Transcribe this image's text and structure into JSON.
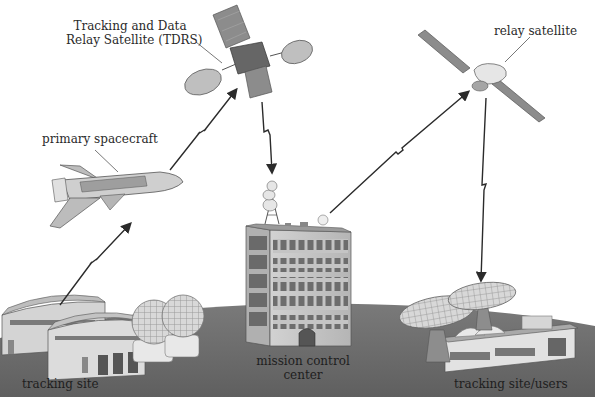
{
  "diagram": {
    "type": "satellite communication network",
    "labels": {
      "tdrs_line1": "Tracking and Data",
      "tdrs_line2": "Relay Satellite (TDRS)",
      "relay_satellite": "relay satellite",
      "primary_spacecraft": "primary spacecraft",
      "mission_control_line1": "mission control",
      "mission_control_line2": "center",
      "tracking_site": "tracking site",
      "tracking_site_users": "tracking site/users"
    },
    "nodes": [
      {
        "id": "tdrs",
        "label": "Tracking and Data Relay Satellite (TDRS)"
      },
      {
        "id": "relay",
        "label": "relay satellite"
      },
      {
        "id": "shuttle",
        "label": "primary spacecraft"
      },
      {
        "id": "mcc",
        "label": "mission control center"
      },
      {
        "id": "site_left",
        "label": "tracking site"
      },
      {
        "id": "site_right",
        "label": "tracking site/users"
      }
    ],
    "links": [
      {
        "from": "tracking site",
        "to": "primary spacecraft"
      },
      {
        "from": "primary spacecraft",
        "to": "Tracking and Data Relay Satellite (TDRS)"
      },
      {
        "from": "Tracking and Data Relay Satellite (TDRS)",
        "to": "mission control center"
      },
      {
        "from": "mission control center",
        "to": "relay satellite"
      },
      {
        "from": "relay satellite",
        "to": "tracking site/users"
      }
    ],
    "colors": {
      "ground": "#6f6f6f",
      "ground_light": "#8a8a8a",
      "background": "#ffffff",
      "arrow": "#2b2b2b",
      "building": "#c9c9c9",
      "panel": "#8c8c8c"
    }
  }
}
